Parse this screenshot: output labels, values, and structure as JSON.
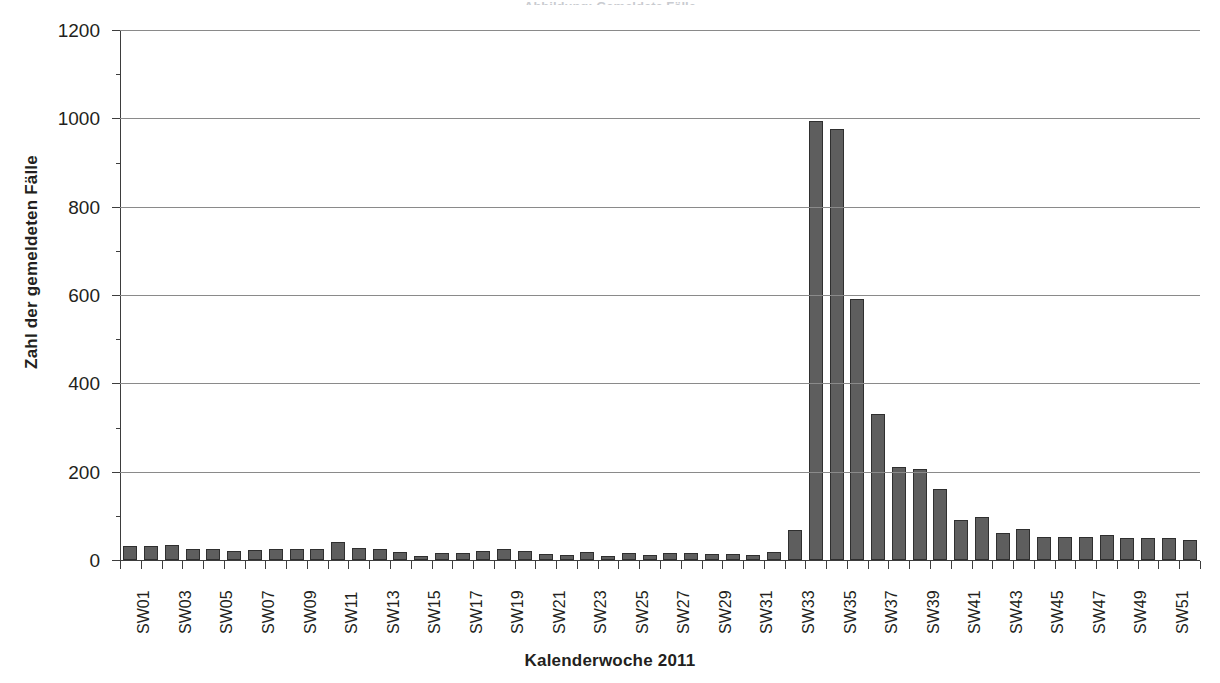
{
  "figure": {
    "cropped_title": "Abbildung: Gemeldete Fälle",
    "x_axis_title": "Kalenderwoche 2011",
    "y_axis_title": "Zahl der gemeldeten Fälle"
  },
  "chart_data": {
    "type": "bar",
    "title": "",
    "xlabel": "Kalenderwoche 2011",
    "ylabel": "Zahl der gemeldeten Fälle",
    "ylim": [
      0,
      1200
    ],
    "yticks": [
      0,
      200,
      400,
      600,
      800,
      1000,
      1200
    ],
    "ytick_labels": [
      "0",
      "200",
      "400",
      "600",
      "800",
      "1000",
      "1200"
    ],
    "grid": true,
    "legend": false,
    "bar_color": "#5e5e5e",
    "bar_edge_color": "#2f2f2f",
    "gridline_color": "#8a8a8a",
    "axis_color": "#3d3d3d",
    "categories": [
      "SW01",
      "SW02",
      "SW03",
      "SW04",
      "SW05",
      "SW06",
      "SW07",
      "SW08",
      "SW09",
      "SW10",
      "SW11",
      "SW12",
      "SW13",
      "SW14",
      "SW15",
      "SW16",
      "SW17",
      "SW18",
      "SW19",
      "SW20",
      "SW21",
      "SW22",
      "SW23",
      "SW24",
      "SW25",
      "SW26",
      "SW27",
      "SW28",
      "SW29",
      "SW30",
      "SW31",
      "SW32",
      "SW33",
      "SW34",
      "SW35",
      "SW36",
      "SW37",
      "SW38",
      "SW39",
      "SW40",
      "SW41",
      "SW42",
      "SW43",
      "SW44",
      "SW45",
      "SW46",
      "SW47",
      "SW48",
      "SW49",
      "SW50",
      "SW51",
      "SW52"
    ],
    "tick_labels_shown": [
      "SW01",
      "SW03",
      "SW05",
      "SW07",
      "SW09",
      "SW11",
      "SW13",
      "SW15",
      "SW17",
      "SW19",
      "SW21",
      "SW23",
      "SW25",
      "SW27",
      "SW29",
      "SW31",
      "SW33",
      "SW35",
      "SW37",
      "SW39",
      "SW41",
      "SW43",
      "SW45",
      "SW47",
      "SW49",
      "SW51"
    ],
    "values": [
      31,
      32,
      34,
      26,
      26,
      20,
      22,
      26,
      25,
      26,
      40,
      28,
      26,
      18,
      9,
      15,
      17,
      20,
      25,
      20,
      13,
      12,
      18,
      9,
      16,
      12,
      17,
      16,
      13,
      13,
      12,
      18,
      68,
      995,
      975,
      590,
      330,
      210,
      205,
      160,
      90,
      97,
      62,
      70,
      53,
      52,
      53,
      57,
      50,
      50,
      50,
      45
    ]
  }
}
